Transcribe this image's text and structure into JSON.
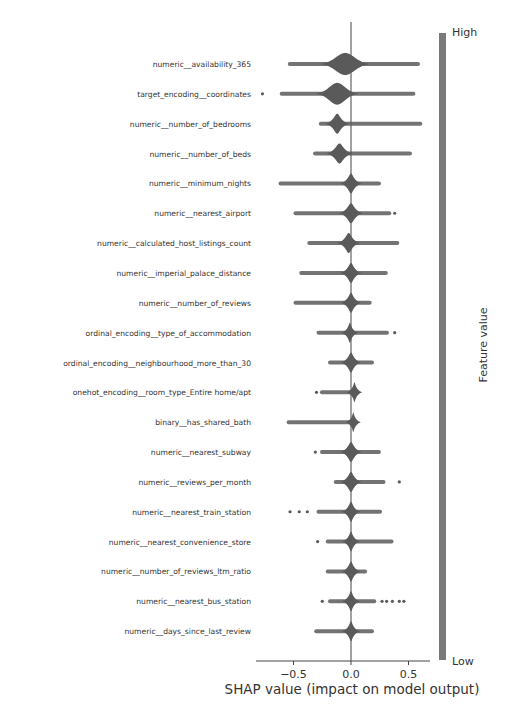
{
  "chart_data": {
    "type": "violin",
    "title": "",
    "xlabel": "SHAP value (impact on model output)",
    "ylabel": "",
    "xlim": [
      -0.82,
      0.68
    ],
    "xticks": [
      -0.5,
      0.0,
      0.5
    ],
    "xtick_labels": [
      "−0.5",
      "0.0",
      "0.5"
    ],
    "grid": false,
    "colorbar": {
      "label": "Feature value",
      "high_label": "High",
      "low_label": "Low",
      "color": "#7a7a7a"
    },
    "violin_color": "#5a5a5a",
    "features": [
      {
        "name": "numeric__availability_365",
        "min": -0.55,
        "max": 0.6,
        "center": -0.05,
        "width": 0.32,
        "half_height": 11
      },
      {
        "name": "target_encoding__coordinates",
        "min": -0.62,
        "max": 0.56,
        "center": -0.12,
        "width": 0.26,
        "half_height": 11,
        "outliers": [
          -0.77
        ]
      },
      {
        "name": "numeric__number_of_bedrooms",
        "min": -0.28,
        "max": 0.62,
        "center": -0.12,
        "width": 0.1,
        "half_height": 10
      },
      {
        "name": "numeric__number_of_beds",
        "min": -0.33,
        "max": 0.53,
        "center": -0.1,
        "width": 0.12,
        "half_height": 10
      },
      {
        "name": "numeric__minimum_nights",
        "min": -0.63,
        "max": 0.26,
        "center": 0.0,
        "width": 0.08,
        "half_height": 10
      },
      {
        "name": "numeric__nearest_airport",
        "min": -0.5,
        "max": 0.35,
        "center": 0.0,
        "width": 0.1,
        "half_height": 10,
        "outliers": [
          0.38
        ]
      },
      {
        "name": "numeric__calculated_host_listings_count",
        "min": -0.38,
        "max": 0.42,
        "center": -0.02,
        "width": 0.09,
        "half_height": 10
      },
      {
        "name": "numeric__imperial_palace_distance",
        "min": -0.45,
        "max": 0.32,
        "center": 0.0,
        "width": 0.08,
        "half_height": 10
      },
      {
        "name": "numeric__number_of_reviews",
        "min": -0.5,
        "max": 0.18,
        "center": 0.0,
        "width": 0.07,
        "half_height": 10
      },
      {
        "name": "ordinal_encoding__type_of_accommodation",
        "min": -0.3,
        "max": 0.33,
        "center": -0.01,
        "width": 0.04,
        "half_height": 10,
        "outliers": [
          0.38
        ]
      },
      {
        "name": "ordinal_encoding__neighbourhood_more_than_30",
        "min": -0.2,
        "max": 0.2,
        "center": 0.0,
        "width": 0.07,
        "half_height": 10
      },
      {
        "name": "onehot_encoding__room_type_Entire home/apt",
        "min": -0.27,
        "max": 0.06,
        "center": 0.03,
        "width": 0.03,
        "half_height": 10,
        "outliers": [
          -0.3
        ]
      },
      {
        "name": "binary__has_shared_bath",
        "min": -0.56,
        "max": 0.04,
        "center": 0.02,
        "width": 0.025,
        "half_height": 10
      },
      {
        "name": "numeric__nearest_subway",
        "min": -0.27,
        "max": 0.26,
        "center": 0.0,
        "width": 0.08,
        "half_height": 10,
        "outliers": [
          -0.31
        ]
      },
      {
        "name": "numeric__reviews_per_month",
        "min": -0.15,
        "max": 0.3,
        "center": 0.0,
        "width": 0.08,
        "half_height": 10,
        "outliers": [
          0.42
        ]
      },
      {
        "name": "numeric__nearest_train_station",
        "min": -0.3,
        "max": 0.27,
        "center": 0.0,
        "width": 0.06,
        "half_height": 10,
        "outliers": [
          -0.53,
          -0.45,
          -0.38
        ]
      },
      {
        "name": "numeric__nearest_convenience_store",
        "min": -0.22,
        "max": 0.37,
        "center": 0.0,
        "width": 0.05,
        "half_height": 10,
        "outliers": [
          -0.29
        ]
      },
      {
        "name": "numeric__number_of_reviews_ltm_ratio",
        "min": -0.22,
        "max": 0.14,
        "center": 0.0,
        "width": 0.06,
        "half_height": 10
      },
      {
        "name": "numeric__nearest_bus_station",
        "min": -0.2,
        "max": 0.22,
        "center": 0.0,
        "width": 0.05,
        "half_height": 10,
        "outliers": [
          -0.25,
          0.27,
          0.31,
          0.36,
          0.42,
          0.46
        ]
      },
      {
        "name": "numeric__days_since_last_review",
        "min": -0.32,
        "max": 0.2,
        "center": 0.0,
        "width": 0.05,
        "half_height": 10
      }
    ]
  }
}
